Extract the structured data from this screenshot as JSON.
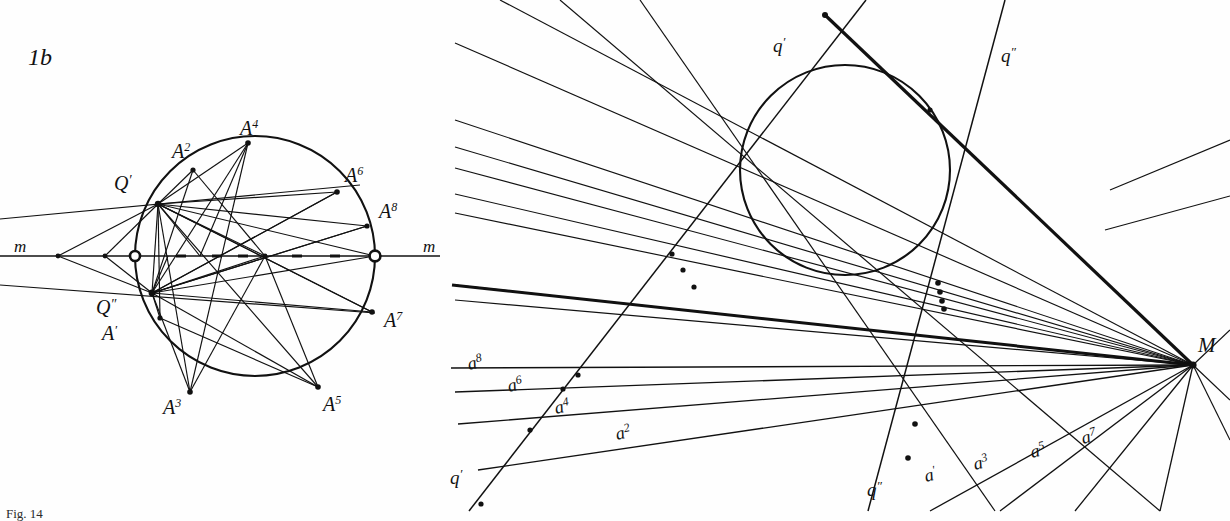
{
  "figure": {
    "type": "geometric-construction-plate",
    "plate_label": "1b",
    "background": "#fefefe",
    "ink": "#111111",
    "caption_fragment": "Fig. 14"
  },
  "left_panel": {
    "name": "figure-1b",
    "plate_label": "1b",
    "axis_label_left": "m",
    "axis_label_right": "m",
    "circle": {
      "cx": 255,
      "cy": 256,
      "r": 120
    },
    "axis_line": {
      "x1": 0,
      "y1": 256,
      "x2": 440,
      "y2": 256
    },
    "pole_labels": [
      {
        "text": "Q",
        "prime": "′",
        "x": 114,
        "y": 190
      },
      {
        "text": "Q",
        "prime": "″",
        "x": 104,
        "y": 314
      }
    ],
    "point_labels": [
      {
        "text": "A",
        "sup": "′",
        "x": 106,
        "y": 338
      },
      {
        "text": "A",
        "sup": "2",
        "x": 175,
        "y": 155
      },
      {
        "text": "A",
        "sup": "3",
        "x": 165,
        "y": 412
      },
      {
        "text": "A",
        "sup": "4",
        "x": 243,
        "y": 133
      },
      {
        "text": "A",
        "sup": "5",
        "x": 325,
        "y": 409
      },
      {
        "text": "A",
        "sup": "6",
        "x": 347,
        "y": 180
      },
      {
        "text": "A",
        "sup": "7",
        "x": 386,
        "y": 325
      },
      {
        "text": "A",
        "sup": "8",
        "x": 381,
        "y": 216
      }
    ],
    "marked_points": {
      "Qp": [
        158,
        204
      ],
      "Qpp": [
        152,
        293
      ],
      "A1": [
        160,
        318
      ],
      "A2": [
        193,
        170
      ],
      "A3": [
        190,
        392
      ],
      "A4": [
        248,
        143
      ],
      "A5": [
        318,
        387
      ],
      "A6": [
        337,
        192
      ],
      "A7": [
        372,
        312
      ],
      "A8": [
        367,
        226
      ]
    },
    "axis_nodes": [
      [
        58,
        256
      ],
      [
        105,
        256
      ],
      [
        135,
        256
      ],
      [
        152,
        256
      ],
      [
        168,
        256
      ],
      [
        200,
        256
      ],
      [
        265,
        256
      ],
      [
        375,
        256
      ]
    ],
    "open_circle_markers": [
      [
        135,
        256
      ],
      [
        375,
        256
      ]
    ]
  },
  "right_panel": {
    "name": "figure-dual-construction",
    "circle": {
      "cx": 845,
      "cy": 170,
      "r": 105
    },
    "point_M": {
      "x": 1193,
      "y": 365,
      "label": "M"
    },
    "line_labels": [
      {
        "text": "q",
        "sup": "′",
        "x": 778,
        "y": 49,
        "rot": 0
      },
      {
        "text": "q",
        "sup": "″",
        "x": 1005,
        "y": 58,
        "rot": 0
      },
      {
        "text": "q",
        "sup": "′",
        "x": 455,
        "y": 481,
        "rot": 0
      },
      {
        "text": "q",
        "sup": "″",
        "x": 872,
        "y": 493,
        "rot": 0
      },
      {
        "text": "a",
        "sup": "′",
        "x": 931,
        "y": 478,
        "rot": -14
      },
      {
        "text": "a",
        "sup": "2",
        "x": 565,
        "y": 432,
        "rot": -13
      },
      {
        "text": "a",
        "sup": "3",
        "x": 986,
        "y": 468,
        "rot": -14
      },
      {
        "text": "a",
        "sup": "4",
        "x": 515,
        "y": 407,
        "rot": -13
      },
      {
        "text": "a",
        "sup": "5",
        "x": 1040,
        "y": 456,
        "rot": -14
      },
      {
        "text": "a",
        "sup": "6",
        "x": 492,
        "y": 387,
        "rot": -13
      },
      {
        "text": "a",
        "sup": "7",
        "x": 1090,
        "y": 441,
        "rot": -14
      },
      {
        "text": "a",
        "sup": "8",
        "x": 473,
        "y": 365,
        "rot": -13
      }
    ],
    "intersection_cluster": {
      "x": 940,
      "y": 295,
      "count": 8
    },
    "apex_node": {
      "x": 825,
      "y": 15
    }
  }
}
